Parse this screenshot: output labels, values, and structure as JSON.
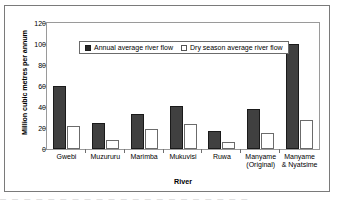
{
  "chart_data": {
    "type": "bar",
    "title": "",
    "xlabel": "River",
    "ylabel": "Million cubic metres per annum",
    "ylim": [
      0,
      120
    ],
    "yticks": [
      0,
      20,
      40,
      60,
      80,
      100,
      120
    ],
    "grid": false,
    "legend_position": "inside-top-center",
    "categories": [
      "Gwebi",
      "Muzururu",
      "Marimba",
      "Mukuvisi",
      "Ruwa",
      "Manyame\n(Original)",
      "Manyame\n& Nyatsime"
    ],
    "series": [
      {
        "name": "Annual average river flow",
        "color": "#404040",
        "values": [
          60,
          25,
          33,
          41,
          17,
          38,
          100
        ]
      },
      {
        "name": "Dry season average river flow",
        "color": "#ffffff",
        "values": [
          22,
          9,
          19,
          24,
          7,
          15,
          28
        ]
      }
    ]
  },
  "caption_strip": "— — —   — — — — —   — — —   — — — —   — — — —   — —"
}
